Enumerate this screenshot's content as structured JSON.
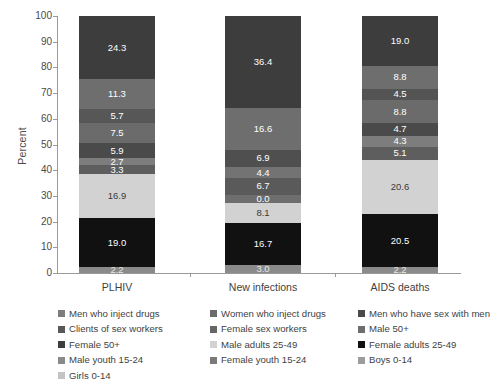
{
  "chart_data": {
    "type": "bar",
    "subtype": "stacked-percent",
    "title": "",
    "xlabel": "",
    "ylabel": "Percent",
    "ylim": [
      0,
      100
    ],
    "yticks": [
      0,
      10,
      20,
      30,
      40,
      50,
      60,
      70,
      80,
      90,
      100
    ],
    "ytick_labels": [
      "0",
      "10",
      "20",
      "30",
      "40",
      "50",
      "60",
      "70",
      "80",
      "90",
      "100"
    ],
    "grid": false,
    "legend_position": "below",
    "categories": [
      "PLHIV",
      "New infections",
      "AIDS deaths"
    ],
    "series": [
      {
        "name": "Men who inject drugs",
        "color": "#7d7d7d",
        "values": [
          2.7,
          6.7,
          4.3
        ]
      },
      {
        "name": "Women who inject drugs",
        "color": "#6b6b6b",
        "values": [
          3.3,
          0.0,
          5.1
        ]
      },
      {
        "name": "Men who have sex with men",
        "color": "#4a4a4a",
        "values": [
          5.9,
          4.4,
          4.7
        ]
      },
      {
        "name": "Clients of sex workers",
        "color": "#585858",
        "values": [
          7.5,
          6.9,
          8.8
        ]
      },
      {
        "name": "Female sex workers",
        "color": "#666666",
        "values": [
          5.7,
          16.6,
          4.5
        ]
      },
      {
        "name": "Male 50+",
        "color": "#6e6e6e",
        "values": [
          11.3,
          16.6,
          8.8
        ]
      },
      {
        "name": "Female 50+",
        "color": "#3d3d3d",
        "values": [
          24.3,
          36.4,
          19.0
        ]
      },
      {
        "name": "Male adults 25-49",
        "color": "#d2d2d2",
        "values": [
          16.9,
          8.1,
          20.6
        ]
      },
      {
        "name": "Female adults 25-49",
        "color": "#111111",
        "values": [
          19.0,
          16.7,
          20.5
        ]
      },
      {
        "name": "Male youth 15-24",
        "color": "#8a8a8a",
        "values": [
          2.2,
          3.0,
          2.2
        ]
      },
      {
        "name": "Female youth 15-24",
        "color": "#7a7a7a",
        "values": [
          0,
          0,
          0
        ]
      },
      {
        "name": "Boys 0-14",
        "color": "#9c9c9c",
        "values": [
          0,
          0,
          0
        ]
      },
      {
        "name": "Girls 0-14",
        "color": "#c4c4c4",
        "values": [
          0,
          0,
          0
        ]
      }
    ],
    "bars": [
      {
        "category": "PLHIV",
        "segments": [
          {
            "label": "24.3",
            "value": 24.3,
            "color": "#3d3d3d",
            "text_color": "#ffffff",
            "series": "Female 50+"
          },
          {
            "label": "11.3",
            "value": 11.3,
            "color": "#6e6e6e",
            "text_color": "#ffffff",
            "series": "Male 50+"
          },
          {
            "label": "5.7",
            "value": 5.7,
            "color": "#575757",
            "text_color": "#ffffff",
            "series": "Female sex workers"
          },
          {
            "label": "7.5",
            "value": 7.5,
            "color": "#6b6b6b",
            "text_color": "#ffffff",
            "series": "Clients of sex workers"
          },
          {
            "label": "5.9",
            "value": 5.9,
            "color": "#4a4a4a",
            "text_color": "#ffffff",
            "series": "Men who have sex with men"
          },
          {
            "label": "2.7",
            "value": 2.7,
            "color": "#7d7d7d",
            "text_color": "#ffffff",
            "series": "Men who inject drugs"
          },
          {
            "label": "3.3",
            "value": 3.3,
            "color": "#5e5e5e",
            "text_color": "#ffffff",
            "series": "Women who inject drugs"
          },
          {
            "label": "16.9",
            "value": 16.9,
            "color": "#d2d2d2",
            "text_color": "#3a3a3a",
            "series": "Male adults 25-49"
          },
          {
            "label": "19.0",
            "value": 19.0,
            "color": "#111111",
            "text_color": "#ffffff",
            "series": "Female adults 25-49"
          },
          {
            "label": "2.2",
            "value": 2.2,
            "color": "#8a8a8a",
            "text_color": "#e8e8e8",
            "series": "Male youth 15-24"
          }
        ]
      },
      {
        "category": "New infections",
        "segments": [
          {
            "label": "36.4",
            "value": 36.4,
            "color": "#3d3d3d",
            "text_color": "#ffffff",
            "series": "Female 50+"
          },
          {
            "label": "16.6",
            "value": 16.6,
            "color": "#6e6e6e",
            "text_color": "#ffffff",
            "series": "Male 50+"
          },
          {
            "label": "6.9",
            "value": 6.9,
            "color": "#4f4f4f",
            "text_color": "#ffffff",
            "series": "Clients of sex workers"
          },
          {
            "label": "4.4",
            "value": 4.4,
            "color": "#737373",
            "text_color": "#ffffff",
            "series": "Men who have sex with men"
          },
          {
            "label": "6.7",
            "value": 6.7,
            "color": "#5a5a5a",
            "text_color": "#ffffff",
            "series": "Men who inject drugs"
          },
          {
            "label": "0.0",
            "value": 3.2,
            "color": "#6e6e6e",
            "text_color": "#ffffff",
            "series": "Women who inject drugs"
          },
          {
            "label": "8.1",
            "value": 8.1,
            "color": "#d2d2d2",
            "text_color": "#3a3a3a",
            "series": "Male adults 25-49"
          },
          {
            "label": "16.7",
            "value": 16.7,
            "color": "#111111",
            "text_color": "#ffffff",
            "series": "Female adults 25-49"
          },
          {
            "label": "3.0",
            "value": 3.0,
            "color": "#8a8a8a",
            "text_color": "#e8e8e8",
            "series": "Male youth 15-24"
          }
        ]
      },
      {
        "category": "AIDS deaths",
        "segments": [
          {
            "label": "19.0",
            "value": 19.0,
            "color": "#3d3d3d",
            "text_color": "#ffffff",
            "series": "Female 50+"
          },
          {
            "label": "8.8",
            "value": 8.8,
            "color": "#6e6e6e",
            "text_color": "#ffffff",
            "series": "Male 50+"
          },
          {
            "label": "4.5",
            "value": 4.5,
            "color": "#545454",
            "text_color": "#ffffff",
            "series": "Female sex workers"
          },
          {
            "label": "8.8",
            "value": 8.8,
            "color": "#6b6b6b",
            "text_color": "#ffffff",
            "series": "Clients of sex workers"
          },
          {
            "label": "4.7",
            "value": 4.7,
            "color": "#4a4a4a",
            "text_color": "#ffffff",
            "series": "Men who have sex with men"
          },
          {
            "label": "4.3",
            "value": 4.3,
            "color": "#7d7d7d",
            "text_color": "#ffffff",
            "series": "Men who inject drugs"
          },
          {
            "label": "5.1",
            "value": 5.1,
            "color": "#5e5e5e",
            "text_color": "#ffffff",
            "series": "Women who inject drugs"
          },
          {
            "label": "20.6",
            "value": 20.6,
            "color": "#d2d2d2",
            "text_color": "#3a3a3a",
            "series": "Male adults 25-49"
          },
          {
            "label": "20.5",
            "value": 20.5,
            "color": "#111111",
            "text_color": "#ffffff",
            "series": "Female adults 25-49"
          },
          {
            "label": "2.2",
            "value": 2.2,
            "color": "#8a8a8a",
            "text_color": "#e8e8e8",
            "series": "Male youth 15-24"
          }
        ]
      }
    ],
    "legend_rows": [
      [
        {
          "label": "Men who inject drugs",
          "color": "#7d7d7d"
        },
        {
          "label": "Women who inject drugs",
          "color": "#6b6b6b"
        },
        {
          "label": "Men who have sex with men",
          "color": "#4a4a4a"
        }
      ],
      [
        {
          "label": "Clients of sex workers",
          "color": "#585858"
        },
        {
          "label": "Female sex workers",
          "color": "#666666"
        },
        {
          "label": "Male 50+",
          "color": "#6e6e6e"
        }
      ],
      [
        {
          "label": "Female 50+",
          "color": "#3d3d3d"
        },
        {
          "label": "Male adults 25-49",
          "color": "#d2d2d2"
        },
        {
          "label": "Female adults 25-49",
          "color": "#111111"
        }
      ],
      [
        {
          "label": "Male youth 15-24",
          "color": "#8a8a8a"
        },
        {
          "label": "Female youth 15-24",
          "color": "#7a7a7a"
        },
        {
          "label": "Boys 0-14",
          "color": "#9c9c9c"
        }
      ],
      [
        {
          "label": "Girls 0-14",
          "color": "#c4c4c4"
        }
      ]
    ]
  },
  "axis": {
    "y_title": "Percent"
  }
}
